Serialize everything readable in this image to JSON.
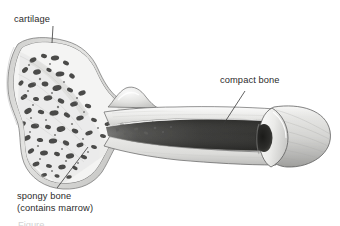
{
  "figure": {
    "background_color": "#ffffff",
    "width": 340,
    "height": 226,
    "medium": "pencil shaded anatomical illustration",
    "ink_color": "#2b2b2b"
  },
  "labels": {
    "cartilage": {
      "text": "cartilage",
      "leader_from": [
        53,
        26
      ],
      "leader_to": [
        52,
        43
      ]
    },
    "compact_bone": {
      "text": "compact bone",
      "leader_from": [
        245,
        91
      ],
      "leader_to": [
        221,
        128
      ]
    },
    "spongy_bone": {
      "line1": "spongy bone",
      "line2": "(contains marrow)",
      "leader_from": [
        57,
        188
      ],
      "leader_to": [
        88,
        147
      ]
    }
  },
  "structures": {
    "epiphysis": {
      "name": "bone head (epiphysis)",
      "fill": "#efefee",
      "outline": "#5a5a5a"
    },
    "cartilage_rim": {
      "name": "articular cartilage rim",
      "fill": "#d8d8d6",
      "outline": "#6e6e6e"
    },
    "spongy_bone_region": {
      "name": "spongy bone trabeculae",
      "cavity_color": "#4a4a4a",
      "matrix_color": "#f2f2f1"
    },
    "tubercle": {
      "name": "tubercle bump",
      "fill": "#e6e6e4"
    },
    "diaphysis": {
      "name": "shaft (diaphysis)",
      "fill": "#f0f0ee",
      "outline": "#6a6a6a"
    },
    "marrow_cavity": {
      "name": "medullary (marrow) cavity",
      "fill": "#3c3c3c"
    },
    "cut_end": {
      "name": "cut cylindrical end",
      "fill": "#e2e2e0",
      "outline": "#5a5a5a"
    }
  },
  "bottom_edge": {
    "clipped_caption": "Figure"
  }
}
